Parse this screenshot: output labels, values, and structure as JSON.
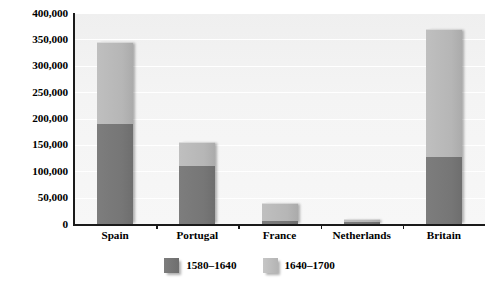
{
  "chart_data": {
    "type": "bar",
    "subtype": "stacked-bar",
    "title": "",
    "subtitle": "",
    "xlabel": "",
    "ylabel": "",
    "categories": [
      "Spain",
      "Portugal",
      "France",
      "Netherlands",
      "Britain"
    ],
    "series": [
      {
        "name": "1580–1640",
        "color": "#767676",
        "values": [
          190000,
          110000,
          5000,
          3000,
          127000
        ]
      },
      {
        "name": "1640–1700",
        "color": "#b8b8b8",
        "values": [
          155000,
          45000,
          35000,
          7000,
          243000
        ]
      }
    ],
    "totals": [
      345000,
      155000,
      40000,
      10000,
      370000
    ],
    "ylim": [
      0,
      400000
    ],
    "ytick_step": 50000,
    "ytick_labels": [
      "400,000",
      "350,000",
      "300,000",
      "250,000",
      "200,000",
      "150,000",
      "100,000",
      "50,000",
      "0"
    ],
    "ytick_values": [
      400000,
      350000,
      300000,
      250000,
      200000,
      150000,
      100000,
      50000,
      0
    ],
    "grid": true,
    "grid_color": "#ffffff",
    "plot_background": "#f2f2f2",
    "legend_position": "bottom",
    "legend": [
      {
        "label": "1580–1640",
        "color": "#767676"
      },
      {
        "label": "1640–1700",
        "color": "#b8b8b8"
      }
    ]
  }
}
